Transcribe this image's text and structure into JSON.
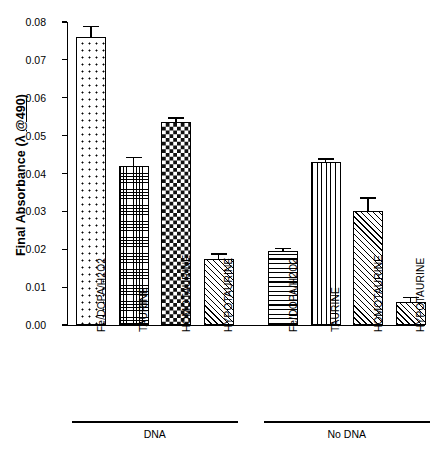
{
  "chart_data": {
    "type": "bar",
    "title": "",
    "xlabel": "",
    "ylabel": "Final Absorbance (λ @490)",
    "ylabel_parts": {
      "prefix": "Final Absorbance (λ ",
      "underlined": "@490",
      "suffix": ")"
    },
    "ylim": [
      0.0,
      0.08
    ],
    "ytick_labels": [
      "0.08",
      "0.07",
      "0.06",
      "0.05",
      "0.04",
      "0.03",
      "0.02",
      "0.01",
      "0.00"
    ],
    "ytick_values": [
      0.08,
      0.07,
      0.06,
      0.05,
      0.04,
      0.03,
      0.02,
      0.01,
      0.0
    ],
    "grid": false,
    "legend": "none",
    "categories": [
      "Fe/DOPA/H2O2",
      "TAURINE",
      "HOMOTAURINE",
      "HYPOTAURINE",
      "Fe/DOPA/H2O2",
      "TAURINE",
      "HOMOTAURINE",
      "HYPOTAURINE"
    ],
    "values": [
      0.076,
      0.042,
      0.0535,
      0.0175,
      0.0195,
      0.043,
      0.03,
      0.006
    ],
    "errors": [
      0.003,
      0.0023,
      0.0013,
      0.0014,
      0.0008,
      0.001,
      0.0037,
      0.0015
    ],
    "patterns": [
      "dots-sparse",
      "grid-fine",
      "checker",
      "diag",
      "horiz",
      "vert",
      "diag",
      "diag"
    ],
    "groups": [
      {
        "label": "DNA",
        "bars": [
          0,
          1,
          2,
          3
        ]
      },
      {
        "label": "No DNA",
        "bars": [
          4,
          5,
          6,
          7
        ]
      }
    ]
  },
  "colors": {
    "axis": "#000000",
    "bar_outline": "#000000",
    "bar_fill": "#ffffff",
    "background": "#ffffff"
  }
}
